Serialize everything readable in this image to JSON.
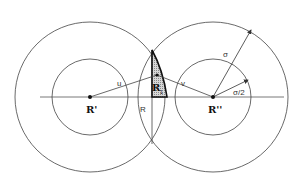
{
  "diagram": {
    "labels": {
      "r_prime": "R'",
      "r_double_prime": "R''",
      "r1_main": "R",
      "r1_sub": "1",
      "u": "u",
      "v": "v",
      "R": "R",
      "sigma": "σ",
      "sigma_half": "σ/2"
    },
    "colors": {
      "stroke": "#333333",
      "hatch": "#9a9a9a",
      "background": "#ffffff"
    }
  }
}
